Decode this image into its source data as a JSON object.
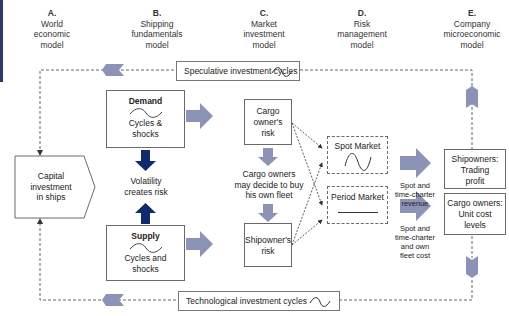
{
  "columns": [
    {
      "letter": "A.",
      "lines": [
        "World",
        "economic",
        "model"
      ]
    },
    {
      "letter": "B.",
      "lines": [
        "Shipping",
        "fundamentals",
        "model"
      ]
    },
    {
      "letter": "C.",
      "lines": [
        "Market",
        "investment",
        "model"
      ]
    },
    {
      "letter": "D.",
      "lines": [
        "Risk",
        "management",
        "model"
      ]
    },
    {
      "letter": "E.",
      "lines": [
        "Company",
        "microeconomic",
        "model"
      ]
    }
  ],
  "cycles": {
    "speculative": {
      "label": "Speculative investment cycles",
      "icon": "sine-wave-icon"
    },
    "technological": {
      "label": "Technological investment cycles",
      "icon": "sine-wave-icon"
    }
  },
  "capital": {
    "lines": [
      "Capital",
      "investment",
      "in ships"
    ]
  },
  "demand": {
    "title": "Demand",
    "lines": [
      "Cycles &",
      "shocks"
    ],
    "icon": "sine-wave-icon"
  },
  "supply": {
    "title": "Supply",
    "lines": [
      "Cycles and",
      "shocks"
    ],
    "icon": "sine-wave-icon"
  },
  "volatility": {
    "lines": [
      "Volatility",
      "creates risk"
    ]
  },
  "cargo_risk": {
    "lines": [
      "Cargo",
      "owner's",
      "risk"
    ]
  },
  "cargo_decide": {
    "lines": [
      "Cargo owners",
      "may decide to buy",
      "his own fleet"
    ]
  },
  "shipowner_risk": {
    "lines": [
      "Shipowner's",
      "risk"
    ]
  },
  "spot_market": {
    "label": "Spot Market",
    "icon": "sine-wave-icon"
  },
  "period_market": {
    "label": "Period Market",
    "icon": "flat-line-icon"
  },
  "revenue_label": {
    "lines": [
      "Spot and",
      "time-charter",
      "revenue"
    ]
  },
  "cost_label": {
    "lines": [
      "Spot and",
      "time-charter",
      "and own",
      "fleet cost"
    ]
  },
  "shipowners_profit": {
    "lines": [
      "Shipowners:",
      "Trading",
      "profit"
    ]
  },
  "cargo_cost": {
    "lines": [
      "Cargo owners:",
      "Unit cost",
      "levels"
    ]
  },
  "colors": {
    "block_arrow": "#8c93b8",
    "dark_arrow": "#0f2a6e",
    "edge_strip": "#2b3a6e",
    "border": "#6a6a6a"
  }
}
